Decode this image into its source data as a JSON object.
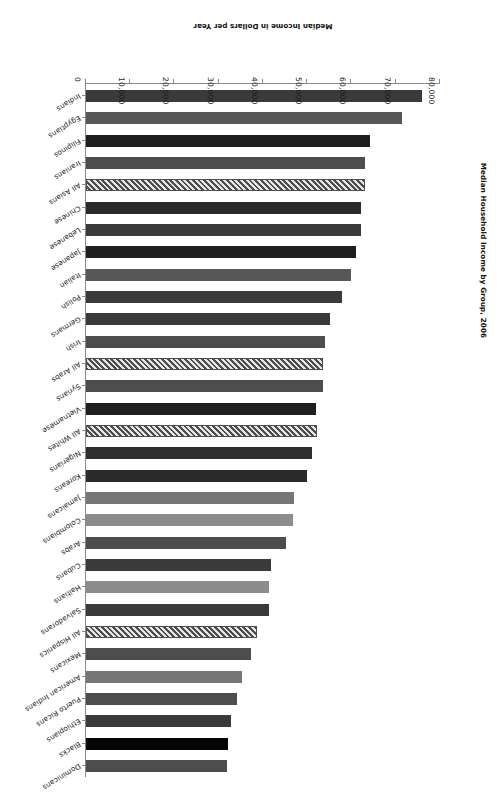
{
  "chart": {
    "title": "Median Household Income by Group, 2006",
    "xlabel": "Median Income in Dollars per Year",
    "ylabel": ""
  },
  "axis": {
    "tick_labels": [
      "80,000",
      "70,000",
      "60,000",
      "50,000",
      "40,000",
      "30,000",
      "20,000",
      "10,000",
      "0"
    ],
    "tick_values": [
      80000,
      70000,
      60000,
      50000,
      40000,
      30000,
      20000,
      10000,
      0
    ]
  },
  "style": {
    "bar_dark": "#3a3a3a",
    "bar_black": "#050505",
    "bar_mid": "#4d4d4d",
    "bar_light": "#767676",
    "bar_lighter": "#8c8c8c",
    "axis_color": "#8a8a8a",
    "text_color": "#1a1a1a",
    "background": "#ffffff"
  },
  "chart_data": {
    "type": "bar",
    "orientation": "horizontal",
    "title": "Median Household Income by Group, 2006",
    "xlabel": "Median Income in Dollars per Year",
    "ylabel": "",
    "xlim": [
      0,
      80000
    ],
    "grid": false,
    "legend": "none",
    "categories": [
      "Dominicans",
      "Blacks",
      "Ethiopians",
      "Puerto Ricans",
      "American Indians",
      "Mexicans",
      "All Hispanics",
      "Salvadorans",
      "Haitians",
      "Cubans",
      "Arabs",
      "Colombians",
      "Jamaicans",
      "Koreans",
      "Nigerians",
      "All Whites",
      "Vietnamese",
      "Syrians",
      "All Arabs",
      "Irish",
      "Germans",
      "Polish",
      "Italian",
      "Japanese",
      "Lebanese",
      "Chinese",
      "All Asians",
      "Iranians",
      "Filipinos",
      "Egyptians",
      "Indians"
    ],
    "values": [
      31900,
      32000,
      32800,
      34100,
      35300,
      37400,
      38700,
      41400,
      41400,
      41800,
      45200,
      46800,
      47000,
      49900,
      51100,
      52200,
      52000,
      53600,
      53600,
      54000,
      55100,
      57900,
      59900,
      61000,
      62100,
      62100,
      63000,
      63000,
      64200,
      71400,
      76000
    ],
    "bar_styles": [
      {
        "fill": "#4d4d4d",
        "hatch": false
      },
      {
        "fill": "#050505",
        "hatch": false
      },
      {
        "fill": "#3a3a3a",
        "hatch": false
      },
      {
        "fill": "#4d4d4d",
        "hatch": false
      },
      {
        "fill": "#767676",
        "hatch": false
      },
      {
        "fill": "#4d4d4d",
        "hatch": false
      },
      {
        "fill": "#4d4d4d",
        "hatch": true
      },
      {
        "fill": "#3a3a3a",
        "hatch": false
      },
      {
        "fill": "#8c8c8c",
        "hatch": false
      },
      {
        "fill": "#3a3a3a",
        "hatch": false
      },
      {
        "fill": "#4d4d4d",
        "hatch": false
      },
      {
        "fill": "#8c8c8c",
        "hatch": false
      },
      {
        "fill": "#767676",
        "hatch": false
      },
      {
        "fill": "#2a2a2a",
        "hatch": false
      },
      {
        "fill": "#2f2f2f",
        "hatch": false
      },
      {
        "fill": "#4d4d4d",
        "hatch": true
      },
      {
        "fill": "#1f1f1f",
        "hatch": false
      },
      {
        "fill": "#4d4d4d",
        "hatch": false
      },
      {
        "fill": "#4d4d4d",
        "hatch": true
      },
      {
        "fill": "#4d4d4d",
        "hatch": false
      },
      {
        "fill": "#3a3a3a",
        "hatch": false
      },
      {
        "fill": "#3a3a3a",
        "hatch": false
      },
      {
        "fill": "#585858",
        "hatch": false
      },
      {
        "fill": "#1f1f1f",
        "hatch": false
      },
      {
        "fill": "#3a3a3a",
        "hatch": false
      },
      {
        "fill": "#2a2a2a",
        "hatch": false
      },
      {
        "fill": "#4d4d4d",
        "hatch": true
      },
      {
        "fill": "#4d4d4d",
        "hatch": false
      },
      {
        "fill": "#1f1f1f",
        "hatch": false
      },
      {
        "fill": "#585858",
        "hatch": false
      },
      {
        "fill": "#3a3a3a",
        "hatch": false
      }
    ]
  }
}
